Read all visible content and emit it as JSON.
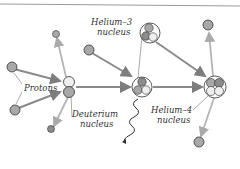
{
  "diagram": {
    "labels": {
      "protons": "Protons",
      "deuterium_1": "Deuterium",
      "deuterium_2": "nucleus",
      "helium3_1": "Helium–3",
      "helium3_2": "nucleus",
      "helium4_1": "Helium–4",
      "helium4_2": "nucleus"
    },
    "colors": {
      "arrow": "#8a8a8a",
      "arrow_light": "#b5b5b5",
      "particle": "#b0b0b0",
      "particle_dark": "#8c8c8c",
      "outline": "#333333",
      "white": "#f2f2f2"
    },
    "nodes": [
      {
        "id": "proton-1",
        "type": "proton"
      },
      {
        "id": "proton-2",
        "type": "proton"
      },
      {
        "id": "deuterium",
        "type": "deuterium"
      },
      {
        "id": "helium-3-incoming",
        "type": "helium-3"
      },
      {
        "id": "helium-3",
        "type": "helium-3"
      },
      {
        "id": "helium-4",
        "type": "helium-4"
      },
      {
        "id": "emitted-positron",
        "type": "particle"
      },
      {
        "id": "emitted-neutrino",
        "type": "particle"
      },
      {
        "id": "gamma-ray",
        "type": "photon"
      },
      {
        "id": "emitted-proton-top",
        "type": "proton"
      },
      {
        "id": "emitted-proton-bottom",
        "type": "proton"
      }
    ]
  }
}
